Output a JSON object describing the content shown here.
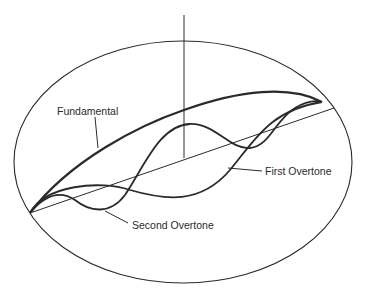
{
  "diagram": {
    "type": "standing-wave-modes",
    "labels": {
      "fundamental": "Fundamental",
      "first_overtone": "First Overtone",
      "second_overtone": "Second Overtone"
    },
    "colors": {
      "ink": "#2a2a2a",
      "background": "#ffffff"
    }
  }
}
